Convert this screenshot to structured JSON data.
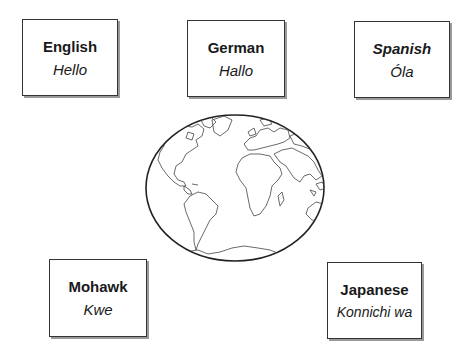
{
  "diagram": {
    "center": {
      "type": "globe",
      "icon": "world-map-globe-icon"
    },
    "cards": [
      {
        "id": "english",
        "language": "English",
        "greeting": "Hello",
        "language_style": "bold"
      },
      {
        "id": "german",
        "language": "German",
        "greeting": "Hallo",
        "language_style": "bold"
      },
      {
        "id": "spanish",
        "language": "Spanish",
        "greeting": "Óla",
        "language_style": "bold-italic"
      },
      {
        "id": "mohawk",
        "language": "Mohawk",
        "greeting": "Kwe",
        "language_style": "bold"
      },
      {
        "id": "japanese",
        "language": "Japanese",
        "greeting": "Konnichi wa",
        "language_style": "bold"
      }
    ]
  },
  "colors": {
    "border": "#333333",
    "shadow": "#9a9a9a",
    "text": "#1a1a1a",
    "background": "#ffffff"
  }
}
